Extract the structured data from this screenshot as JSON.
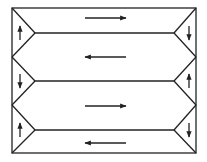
{
  "diagram": {
    "stroke_color": "#222222",
    "background": "#ffffff",
    "frame": {
      "left": 12,
      "top": 8,
      "right": 196,
      "bottom": 153
    },
    "left_edge_points": [
      8,
      57,
      105,
      153
    ],
    "right_edge_points": [
      8,
      57,
      105,
      153
    ],
    "inner_vertices_y": [
      33,
      81,
      130
    ],
    "inner_left_x": 35,
    "inner_right_x": 174,
    "channels": [
      {
        "name": "channel-1",
        "arrow_y": 18,
        "direction": "right"
      },
      {
        "name": "channel-2",
        "arrow_y": 57,
        "direction": "left"
      },
      {
        "name": "channel-3",
        "arrow_y": 106,
        "direction": "right"
      },
      {
        "name": "channel-4",
        "arrow_y": 143,
        "direction": "left"
      }
    ],
    "left_turn_arrows": [
      {
        "y": 33,
        "direction": "up"
      },
      {
        "y": 81,
        "direction": "down"
      },
      {
        "y": 130,
        "direction": "up"
      }
    ],
    "right_turn_arrows": [
      {
        "y": 33,
        "direction": "down"
      },
      {
        "y": 81,
        "direction": "up"
      },
      {
        "y": 130,
        "direction": "down"
      }
    ],
    "arrow_span": {
      "x1": 85,
      "x2": 126
    }
  }
}
